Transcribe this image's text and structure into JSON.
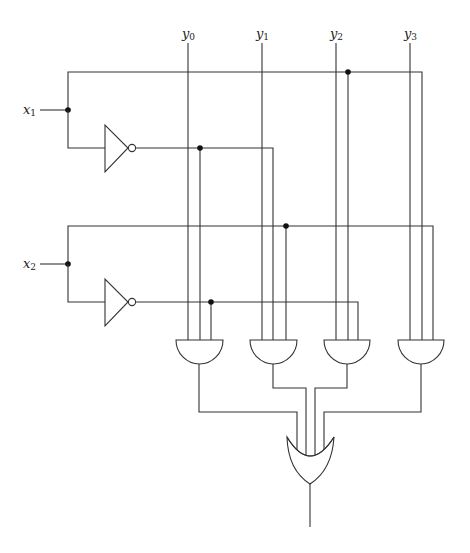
{
  "diagram": {
    "type": "logic-circuit",
    "title": "",
    "inputs": [
      {
        "name": "x1",
        "base": "x",
        "sub": "1"
      },
      {
        "name": "x2",
        "base": "x",
        "sub": "2"
      }
    ],
    "selector_lines": [
      {
        "name": "y0",
        "base": "y",
        "sub": "0"
      },
      {
        "name": "y1",
        "base": "y",
        "sub": "1"
      },
      {
        "name": "y2",
        "base": "y",
        "sub": "2"
      },
      {
        "name": "y3",
        "base": "y",
        "sub": "3"
      }
    ],
    "gates": [
      {
        "id": "not1",
        "type": "NOT",
        "input": "x1"
      },
      {
        "id": "not2",
        "type": "NOT",
        "input": "x2"
      },
      {
        "id": "and0",
        "type": "AND",
        "inputs": [
          "y0",
          "NOT x1",
          "NOT x2"
        ]
      },
      {
        "id": "and1",
        "type": "AND",
        "inputs": [
          "y1",
          "NOT x1",
          "x2"
        ]
      },
      {
        "id": "and2",
        "type": "AND",
        "inputs": [
          "y2",
          "x1",
          "NOT x2"
        ]
      },
      {
        "id": "and3",
        "type": "AND",
        "inputs": [
          "y3",
          "x1",
          "x2"
        ]
      },
      {
        "id": "or0",
        "type": "OR",
        "inputs": [
          "and0",
          "and1",
          "and2",
          "and3"
        ]
      }
    ],
    "colors": {
      "wire": "#333333",
      "background": "#ffffff",
      "junction": "#111111"
    }
  }
}
